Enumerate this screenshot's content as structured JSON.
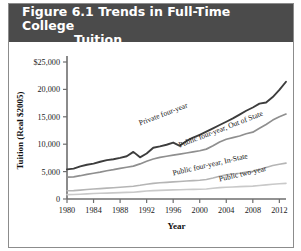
{
  "figure": {
    "title_line1": "Figure 6.1  Trends in Full-Time College",
    "title_line2": "Tuition",
    "band_color": "#4b4b4b",
    "title_color": "#ffffff"
  },
  "chart_data": {
    "type": "line",
    "title": "Figure 6.1  Trends in Full-Time College Tuition",
    "xlabel": "Year",
    "ylabel": "Tuition (Real $2005)",
    "xlim": [
      1980,
      2013
    ],
    "ylim": [
      0,
      25000
    ],
    "grid": false,
    "legend": "inline-labels",
    "xticks": [
      1980,
      1984,
      1988,
      1992,
      1996,
      2000,
      2004,
      2008,
      2012
    ],
    "xtick_labels": [
      "1980",
      "1984",
      "1988",
      "1992",
      "1996",
      "2000",
      "2004",
      "2008",
      "2012"
    ],
    "yticks": [
      0,
      5000,
      10000,
      15000,
      20000,
      25000
    ],
    "ytick_labels": [
      "0",
      "5,000",
      "10,000",
      "15,000",
      "20,000",
      "$25,000"
    ],
    "x": [
      1980,
      1981,
      1982,
      1983,
      1984,
      1985,
      1986,
      1987,
      1988,
      1989,
      1990,
      1991,
      1992,
      1993,
      1994,
      1995,
      1996,
      1997,
      1998,
      1999,
      2000,
      2001,
      2002,
      2003,
      2004,
      2005,
      2006,
      2007,
      2008,
      2009,
      2010,
      2011,
      2012,
      2013
    ],
    "series": [
      {
        "name": "Private four-year",
        "color": "#3d3d3d",
        "width": 1.9,
        "label_x": 1991,
        "label_y": 13400,
        "label_angle": -21,
        "values": [
          5400,
          5550,
          5950,
          6250,
          6450,
          6800,
          7100,
          7250,
          7500,
          7800,
          8600,
          7600,
          8300,
          9350,
          9600,
          9900,
          10300,
          9700,
          10600,
          11200,
          11700,
          12300,
          12900,
          13500,
          14100,
          14700,
          15400,
          16100,
          16700,
          17400,
          17600,
          18600,
          19900,
          21400
        ]
      },
      {
        "name": "Public four-year, Out of State",
        "color": "#8f8f8f",
        "width": 1.7,
        "label_x": 1997,
        "label_y": 9400,
        "label_angle": -21,
        "values": [
          4000,
          4050,
          4250,
          4500,
          4700,
          4900,
          5150,
          5350,
          5600,
          5800,
          6000,
          6400,
          6900,
          7300,
          7600,
          7800,
          8000,
          8200,
          8400,
          8600,
          8800,
          9100,
          9700,
          10400,
          10900,
          11200,
          11500,
          11900,
          12200,
          12900,
          13600,
          14400,
          15000,
          15500
        ]
      },
      {
        "name": "Public four-year, In-State",
        "color": "#b5b5b5",
        "width": 1.6,
        "label_x": 1996,
        "label_y": 4300,
        "label_angle": -13,
        "values": [
          1500,
          1530,
          1620,
          1720,
          1820,
          1900,
          1980,
          2060,
          2150,
          2240,
          2330,
          2500,
          2700,
          2850,
          2960,
          3040,
          3120,
          3200,
          3280,
          3360,
          3430,
          3560,
          3820,
          4150,
          4400,
          4550,
          4700,
          4900,
          5050,
          5400,
          5750,
          6100,
          6350,
          6550
        ]
      },
      {
        "name": "Public two-year",
        "color": "#c9c9c9",
        "width": 1.6,
        "label_x": 2003,
        "label_y": 3200,
        "label_angle": -13,
        "values": [
          800,
          820,
          870,
          930,
          990,
          1040,
          1080,
          1120,
          1160,
          1200,
          1240,
          1340,
          1450,
          1530,
          1580,
          1620,
          1660,
          1700,
          1730,
          1760,
          1780,
          1830,
          1950,
          2080,
          2150,
          2200,
          2250,
          2300,
          2350,
          2450,
          2570,
          2700,
          2780,
          2850
        ]
      }
    ]
  }
}
